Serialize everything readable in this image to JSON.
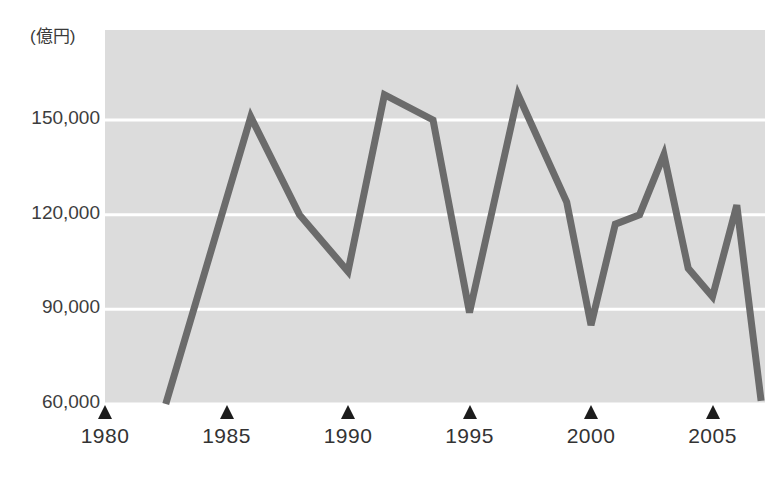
{
  "chart_data": {
    "type": "line",
    "title": "",
    "subtitle": "",
    "xlabel": "",
    "ylabel": "",
    "unit_label": "(億円)",
    "grid": true,
    "legend": null,
    "legend_position": "none",
    "line_color": "#6b6b6b",
    "plot_background": "#dcdcdc",
    "gridline_color": "#ffffff",
    "xlim": [
      1980,
      2007
    ],
    "ylim": [
      60000,
      165000
    ],
    "y_ticks": [
      {
        "value": 150000,
        "label": "150,000"
      },
      {
        "value": 120000,
        "label": "120,000"
      },
      {
        "value": 90000,
        "label": "90,000"
      },
      {
        "value": 60000,
        "label": "60,000"
      }
    ],
    "x_ticks": [
      {
        "value": 1980,
        "label": "1980"
      },
      {
        "value": 1985,
        "label": "1985"
      },
      {
        "value": 1990,
        "label": "1990"
      },
      {
        "value": 1995,
        "label": "1995"
      },
      {
        "value": 2000,
        "label": "2000"
      },
      {
        "value": 2005,
        "label": "2005"
      }
    ],
    "x": [
      1982.5,
      1986,
      1988,
      1990,
      1991.5,
      1993.5,
      1995,
      1997,
      1999,
      2000,
      2001,
      2002,
      2003,
      2004,
      2005,
      2006,
      2007
    ],
    "values": [
      60000,
      151000,
      120000,
      102000,
      158000,
      150000,
      89000,
      158000,
      124000,
      85000,
      117000,
      120000,
      139000,
      103000,
      94000,
      123000,
      61000
    ],
    "series": [
      {
        "name": "金額",
        "color": "#6b6b6b",
        "points": [
          {
            "x": 1982.5,
            "y": 60000
          },
          {
            "x": 1986.0,
            "y": 151000
          },
          {
            "x": 1988.0,
            "y": 120000
          },
          {
            "x": 1990.0,
            "y": 102000
          },
          {
            "x": 1991.5,
            "y": 158000
          },
          {
            "x": 1993.5,
            "y": 150000
          },
          {
            "x": 1995.0,
            "y": 89000
          },
          {
            "x": 1997.0,
            "y": 158000
          },
          {
            "x": 1999.0,
            "y": 124000
          },
          {
            "x": 2000.0,
            "y": 85000
          },
          {
            "x": 2001.0,
            "y": 117000
          },
          {
            "x": 2002.0,
            "y": 120000
          },
          {
            "x": 2003.0,
            "y": 139000
          },
          {
            "x": 2004.0,
            "y": 103000
          },
          {
            "x": 2005.0,
            "y": 94000
          },
          {
            "x": 2006.0,
            "y": 123000
          },
          {
            "x": 2007.0,
            "y": 61000
          }
        ]
      }
    ]
  }
}
